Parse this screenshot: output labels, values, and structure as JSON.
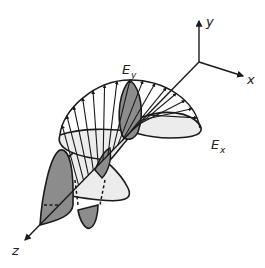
{
  "figure": {
    "axes": {
      "x_label": "x",
      "y_label": "y",
      "z_label": "z"
    },
    "components": {
      "ey": {
        "letter": "E",
        "subscript": "y"
      },
      "ex": {
        "letter": "E",
        "subscript": "x"
      }
    },
    "colors": {
      "dark_lobe": "#8c8c8c",
      "light_lobe": "#ececec",
      "stroke": "#1a1a1a"
    }
  }
}
